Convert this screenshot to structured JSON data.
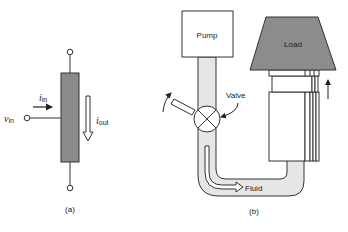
{
  "figure_a": {
    "caption": "(a)",
    "input_voltage": {
      "symbol": "v",
      "subscript": "in"
    },
    "input_current": {
      "symbol": "i",
      "subscript": "in"
    },
    "output_current": {
      "symbol": "i",
      "subscript": "out"
    },
    "colors": {
      "device_fill": "#8a8a8a",
      "stroke": "#333333"
    }
  },
  "figure_b": {
    "caption": "(b)",
    "pump_label": "Pump",
    "valve_label": "Valve",
    "load_label": "Load",
    "fluid_label": "Fluid",
    "colors": {
      "load_fill": "#8c8c8c",
      "pipe_fill": "#e6e6e6",
      "stroke": "#333333"
    }
  }
}
